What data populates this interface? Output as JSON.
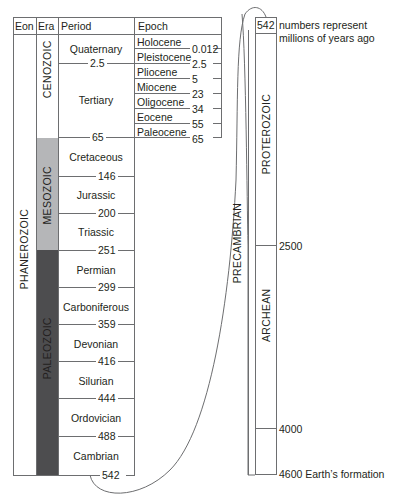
{
  "headers": {
    "eon": "Eon",
    "era": "Era",
    "period": "Period",
    "epoch": "Epoch"
  },
  "eons": {
    "phanerozoic": "PHANEROZOIC",
    "precambrian": "PRECAMBRIAN",
    "proterozoic": "PROTEROZOIC",
    "archean": "ARCHEAN"
  },
  "eras": {
    "cenozoic": {
      "label": "CENOZOIC",
      "color": "#ffffff"
    },
    "mesozoic": {
      "label": "MESOZOIC",
      "color": "#b5b6b8"
    },
    "paleozoic": {
      "label": "PALEOZOIC",
      "color": "#4d4d4f"
    }
  },
  "periods": [
    {
      "name": "Quaternary",
      "end": "2.5"
    },
    {
      "name": "Tertiary",
      "end": "65"
    },
    {
      "name": "Cretaceous",
      "end": "146"
    },
    {
      "name": "Jurassic",
      "end": "200"
    },
    {
      "name": "Triassic",
      "end": "251"
    },
    {
      "name": "Permian",
      "end": "299"
    },
    {
      "name": "Carboniferous",
      "end": "359"
    },
    {
      "name": "Devonian",
      "end": "416"
    },
    {
      "name": "Silurian",
      "end": "444"
    },
    {
      "name": "Ordovician",
      "end": "488"
    },
    {
      "name": "Cambrian",
      "end": "542"
    }
  ],
  "epochs": [
    {
      "name": "Holocene",
      "end": "0.012"
    },
    {
      "name": "Pleistocene",
      "end": "2.5"
    },
    {
      "name": "Pliocene",
      "end": "5"
    },
    {
      "name": "Miocene",
      "end": "23"
    },
    {
      "name": "Oligocene",
      "end": "34"
    },
    {
      "name": "Eocene",
      "end": "55"
    },
    {
      "name": "Paleocene",
      "end": "65"
    }
  ],
  "precambrian_scale": {
    "top": "542",
    "note_line1": "numbers represent",
    "note_line2": "millions of years ago",
    "mark_2500": "2500",
    "mark_4000": "4000",
    "bottom": "4600 Earth’s formation"
  }
}
